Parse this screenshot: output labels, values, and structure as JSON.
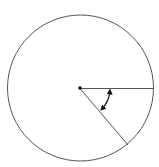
{
  "diagram": {
    "type": "circle-with-central-angle",
    "canvas": {
      "width": 159,
      "height": 167
    },
    "circle": {
      "cx": 80.5,
      "cy": 88,
      "r": 73,
      "stroke": "#555555"
    },
    "center_point": {
      "x": 80,
      "y": 88,
      "r": 1.8,
      "fill": "#111111"
    },
    "radii": [
      {
        "name": "horizontal-radius",
        "x1": 80,
        "y1": 88.5,
        "x2": 153,
        "y2": 88.5
      },
      {
        "name": "diagonal-radius",
        "x1": 80,
        "y1": 88.5,
        "x2": 128,
        "y2": 145
      }
    ],
    "angle_arc": {
      "radius": 30,
      "start_deg": 4,
      "end_deg": 44,
      "double_headed": true,
      "stroke": "#111111"
    },
    "line_color": "#555555",
    "labels": []
  }
}
